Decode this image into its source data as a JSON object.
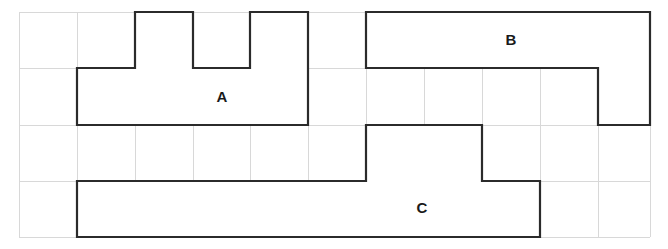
{
  "figure": {
    "background_color": "#ffffff",
    "grid": {
      "line_color": "#d8d8d8",
      "x_lines": [
        19,
        77,
        135,
        193,
        250,
        308,
        366,
        424,
        482,
        540,
        598,
        650
      ],
      "y_lines": [
        12,
        68,
        125,
        181,
        237
      ],
      "columns": 11,
      "rows": 4,
      "cell_width": 58,
      "cell_height": 56
    },
    "shape_color": "#2b2b2b",
    "shape_fill": "#ffffff",
    "shape_stroke_width": 2.2,
    "shapes": [
      {
        "label": "A",
        "label_x": 222,
        "label_y": 98,
        "points": "77,68 135,68 135,12 193,12 193,68 250,68 250,12 308,12 308,125 77,125"
      },
      {
        "label": "B",
        "label_x": 511,
        "label_y": 41,
        "points": "366,12 650,12 650,125 598,125 598,68 366,68"
      },
      {
        "label": "C",
        "label_x": 422,
        "label_y": 209,
        "points": "77,181 366,181 366,125 482,125 482,181 540,181 540,237 77,237"
      }
    ]
  }
}
